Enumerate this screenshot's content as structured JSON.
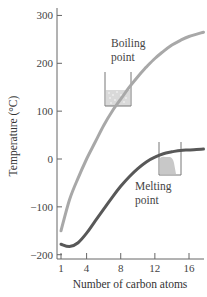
{
  "chart_data": {
    "type": "line",
    "title": "",
    "xlabel": "Number of carbon atoms",
    "ylabel": "Temperature (°C)",
    "xlim": [
      0.5,
      17.7
    ],
    "ylim": [
      -210,
      320
    ],
    "x_ticks": [
      1,
      4,
      8,
      12,
      16
    ],
    "y_ticks": [
      300,
      200,
      100,
      0,
      -100,
      -200
    ],
    "y_tick_labels": [
      "300",
      "200",
      "100",
      "0",
      "−100",
      "−200"
    ],
    "grid": false,
    "legend": "none (inline annotations)",
    "series": [
      {
        "name": "Boiling point",
        "color": "#a8a8a8",
        "x": [
          1,
          2,
          3,
          4,
          5,
          6,
          7,
          8,
          9,
          10,
          11,
          12,
          13,
          14,
          15,
          16,
          17.7
        ],
        "values": [
          -150,
          -85,
          -40,
          0,
          35,
          70,
          100,
          125,
          150,
          172,
          192,
          210,
          225,
          238,
          248,
          256,
          265
        ]
      },
      {
        "name": "Melting point",
        "color": "#585858",
        "x": [
          1,
          2,
          3,
          4,
          5,
          6,
          7,
          8,
          9,
          10,
          11,
          12,
          13,
          14,
          15,
          16,
          17.7
        ],
        "values": [
          -178,
          -183,
          -175,
          -155,
          -130,
          -105,
          -80,
          -57,
          -37,
          -20,
          -6,
          4,
          11,
          15,
          18,
          19,
          21
        ]
      }
    ],
    "annotations": [
      {
        "text_lines": [
          "Boiling",
          "point"
        ],
        "icon": "beaker-with-boiling-liquid",
        "near": "boiling curve at n≈6"
      },
      {
        "text_lines": [
          "Melting",
          "point"
        ],
        "icon": "beaker-with-melting-solid",
        "near": "melting curve at n≈13"
      }
    ]
  }
}
